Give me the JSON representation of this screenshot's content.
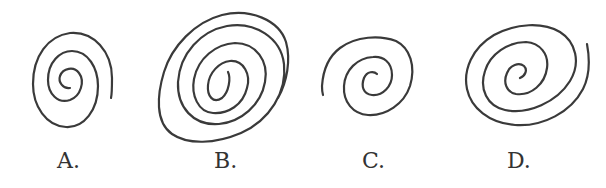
{
  "figure": {
    "options": [
      {
        "id": "A",
        "label": "A.",
        "description": "spiral, approx. 2.5 turns, vertical oval, opening bottom-right"
      },
      {
        "id": "B",
        "label": "B.",
        "description": "spiral, approx. 3 turns, large tilted oval, opening bottom-right"
      },
      {
        "id": "C",
        "label": "C.",
        "description": "spiral, approx. 2 turns, opening bottom-left"
      },
      {
        "id": "D",
        "label": "D.",
        "description": "spiral, approx. 2.5 turns, tilted oval, opening top-right"
      }
    ],
    "stroke_color": "#3a3a3a",
    "background_color": "#ffffff"
  }
}
